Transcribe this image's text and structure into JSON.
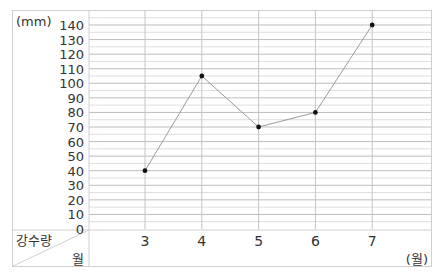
{
  "chart_data": {
    "type": "line",
    "title": "",
    "xlabel": "월",
    "ylabel": "강수량",
    "y_unit_label": "(mm)",
    "x_unit_label": "(월)",
    "corner_top_label": "강수량",
    "corner_bottom_label": "월",
    "categories": [
      "3",
      "4",
      "5",
      "6",
      "7"
    ],
    "x": [
      3,
      4,
      5,
      6,
      7
    ],
    "values": [
      40,
      105,
      70,
      80,
      140
    ],
    "ylim": [
      0,
      150
    ],
    "yticks": [
      0,
      10,
      20,
      30,
      40,
      50,
      60,
      70,
      80,
      90,
      100,
      110,
      120,
      130,
      140
    ],
    "minor_grid_step": 5,
    "grid": true,
    "legend": null
  }
}
